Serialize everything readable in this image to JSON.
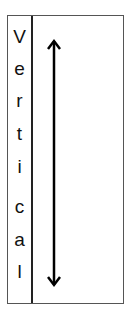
{
  "diagram": {
    "label": "Vertical",
    "letters": [
      "V",
      "e",
      "r",
      "t",
      "i",
      "c",
      "a",
      "l"
    ],
    "arrow": {
      "direction": "bidirectional-vertical",
      "icon": "double-headed-vertical-arrow-icon",
      "color": "#000000"
    },
    "colors": {
      "border": "#555555",
      "divider": "#222222",
      "text": "#111111",
      "background": "#ffffff"
    }
  }
}
